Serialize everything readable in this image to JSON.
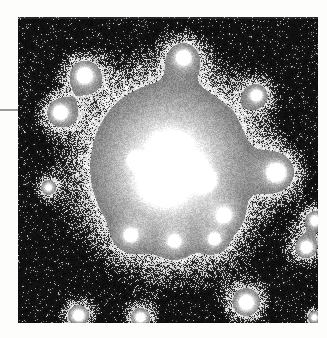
{
  "page": {
    "background_color": "#fdfdfc",
    "width": 327,
    "height": 338
  },
  "margin_rule": {
    "name": "horizontal-rule",
    "color": "#9a9a9a",
    "x": 0,
    "y": 109,
    "width": 18,
    "height": 2
  },
  "figure": {
    "caption": "",
    "alt_text": "Grayscale astronomical image of a galaxy with bright irregular core and diffuse halo surrounded by field stars",
    "plate": {
      "x": 18,
      "y": 17,
      "width": 300,
      "height": 306,
      "sky_color": "#050505",
      "halo_color": "#8d8d8d",
      "inner_halo_color": "#6e6e6e",
      "core_color": "#ffffff",
      "noise_bright": "#c9c9c9",
      "noise_dark": "#0a0a0a"
    },
    "galaxy": {
      "center_x": 152,
      "center_y": 150,
      "halo_radius_x": 118,
      "halo_radius_y": 122,
      "inner_radius_x": 72,
      "inner_radius_y": 80,
      "knots": [
        {
          "name": "core-knot-main",
          "x": 144,
          "y": 163,
          "r": 19,
          "peak": 1.0
        },
        {
          "name": "core-knot-upper",
          "x": 150,
          "y": 133,
          "r": 14,
          "peak": 0.97
        },
        {
          "name": "core-knot-right",
          "x": 172,
          "y": 152,
          "r": 13,
          "peak": 0.93
        },
        {
          "name": "core-knot-east",
          "x": 186,
          "y": 163,
          "r": 10,
          "peak": 0.9
        },
        {
          "name": "core-knot-ne",
          "x": 163,
          "y": 127,
          "r": 8,
          "peak": 0.85
        },
        {
          "name": "core-knot-west",
          "x": 117,
          "y": 143,
          "r": 7,
          "peak": 0.8
        }
      ]
    },
    "field_stars": [
      {
        "name": "star-upper-left-1",
        "x": 66,
        "y": 58,
        "r": 12,
        "peak": 0.88
      },
      {
        "name": "star-upper-left-2",
        "x": 42,
        "y": 95,
        "r": 11,
        "peak": 0.86
      },
      {
        "name": "star-top-center",
        "x": 165,
        "y": 40,
        "r": 11,
        "peak": 0.84
      },
      {
        "name": "star-top-right",
        "x": 238,
        "y": 78,
        "r": 9,
        "peak": 0.78
      },
      {
        "name": "star-right-bright",
        "x": 258,
        "y": 155,
        "r": 13,
        "peak": 0.95
      },
      {
        "name": "star-right-edge-1",
        "x": 297,
        "y": 203,
        "r": 9,
        "peak": 0.74
      },
      {
        "name": "star-right-edge-2",
        "x": 288,
        "y": 230,
        "r": 10,
        "peak": 0.8
      },
      {
        "name": "star-lower-mid-1",
        "x": 112,
        "y": 218,
        "r": 9,
        "peak": 0.72
      },
      {
        "name": "star-lower-mid-2",
        "x": 156,
        "y": 224,
        "r": 8,
        "peak": 0.7
      },
      {
        "name": "star-lower-mid-3",
        "x": 196,
        "y": 222,
        "r": 8,
        "peak": 0.7
      },
      {
        "name": "star-lower-right",
        "x": 206,
        "y": 198,
        "r": 9,
        "peak": 0.76
      },
      {
        "name": "star-bottom-right",
        "x": 228,
        "y": 285,
        "r": 12,
        "peak": 0.86
      },
      {
        "name": "star-bottom-left",
        "x": 60,
        "y": 298,
        "r": 10,
        "peak": 0.78
      },
      {
        "name": "star-bottom-mid",
        "x": 122,
        "y": 300,
        "r": 9,
        "peak": 0.72
      },
      {
        "name": "star-left-mid",
        "x": 30,
        "y": 170,
        "r": 7,
        "peak": 0.62
      },
      {
        "name": "star-right-far",
        "x": 296,
        "y": 300,
        "r": 7,
        "peak": 0.6
      }
    ]
  }
}
